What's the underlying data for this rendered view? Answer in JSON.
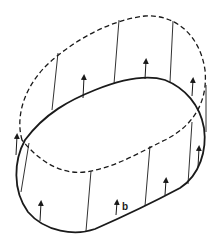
{
  "diagram": {
    "colors": {
      "stroke": "#1a1a1a",
      "background": "#ffffff"
    },
    "labels": [
      {
        "text": "b",
        "x": 122,
        "y": 210
      }
    ],
    "solid_loop_path": "M25,140 C14,160 12,190 28,212 C45,232 75,236 95,229 C120,218 150,204 180,188 C200,175 207,150 204,128 C200,105 185,88 165,80 C145,74 120,80 95,90 C70,100 45,113 25,140 Z",
    "dashed_loop_path": "M22,140 C15,115 25,85 50,62 C75,40 110,20 145,16 C175,14 200,35 205,70 C208,100 195,125 165,140 C140,152 115,168 85,172 C60,175 38,160 22,140 Z",
    "generators": [
      {
        "x1": 58,
        "y1": 53,
        "x2": 52,
        "y2": 110
      },
      {
        "x1": 119,
        "y1": 20,
        "x2": 114,
        "y2": 84
      },
      {
        "x1": 173,
        "y1": 21,
        "x2": 170,
        "y2": 82
      },
      {
        "x1": 206,
        "y1": 85,
        "x2": 206,
        "y2": 132
      },
      {
        "x1": 29,
        "y1": 143,
        "x2": 21,
        "y2": 192
      },
      {
        "x1": 91,
        "y1": 171,
        "x2": 86,
        "y2": 231
      },
      {
        "x1": 150,
        "y1": 146,
        "x2": 145,
        "y2": 206
      },
      {
        "x1": 192,
        "y1": 122,
        "x2": 188,
        "y2": 184
      }
    ],
    "arrows": [
      {
        "x1": 83,
        "y1": 98,
        "x2": 84,
        "y2": 77
      },
      {
        "x1": 145,
        "y1": 79,
        "x2": 146,
        "y2": 61
      },
      {
        "x1": 192,
        "y1": 96,
        "x2": 193,
        "y2": 80
      },
      {
        "x1": 16,
        "y1": 155,
        "x2": 17,
        "y2": 136
      },
      {
        "x1": 40,
        "y1": 221,
        "x2": 41,
        "y2": 203
      },
      {
        "x1": 116,
        "y1": 215,
        "x2": 117,
        "y2": 202
      },
      {
        "x1": 165,
        "y1": 195,
        "x2": 166,
        "y2": 180
      },
      {
        "x1": 198,
        "y1": 167,
        "x2": 199,
        "y2": 148
      }
    ]
  }
}
